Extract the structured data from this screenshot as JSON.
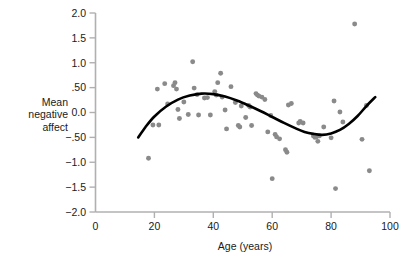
{
  "chart_data": {
    "type": "scatter",
    "title": "",
    "xlabel": "Age (years)",
    "ylabel": "Mean negative affect",
    "xlim": [
      0,
      100
    ],
    "ylim": [
      -2.0,
      2.0
    ],
    "grid": false,
    "legend": null,
    "xticks": [
      0,
      20,
      40,
      60,
      80,
      100
    ],
    "xticklabels": [
      "0",
      "20",
      "40",
      "60",
      "80",
      "100"
    ],
    "yticks": [
      2.0,
      1.5,
      1.0,
      0.5,
      0.0,
      -0.5,
      -1.0,
      -1.5,
      -2.0
    ],
    "yticklabels": [
      "2.0",
      "1.5",
      "1.0",
      ".50",
      "0.0",
      "−.50",
      "−1.0",
      "−1.5",
      "−2.0"
    ],
    "point_color": "#8a8a8a",
    "line_color": "#000000",
    "series": [
      {
        "name": "Mean negative affect by age",
        "marker": "circle",
        "points": [
          [
            18.0,
            -0.92
          ],
          [
            19.5,
            -0.25
          ],
          [
            21.0,
            0.47
          ],
          [
            21.5,
            -0.25
          ],
          [
            23.5,
            0.58
          ],
          [
            24.5,
            0.17
          ],
          [
            26.5,
            0.54
          ],
          [
            27.0,
            0.6
          ],
          [
            27.5,
            0.47
          ],
          [
            28.0,
            0.06
          ],
          [
            28.5,
            -0.12
          ],
          [
            30.0,
            0.21
          ],
          [
            31.5,
            -0.04
          ],
          [
            33.0,
            1.02
          ],
          [
            33.5,
            0.49
          ],
          [
            34.5,
            0.36
          ],
          [
            35.0,
            -0.05
          ],
          [
            37.0,
            0.29
          ],
          [
            38.0,
            0.3
          ],
          [
            39.0,
            -0.05
          ],
          [
            40.5,
            0.42
          ],
          [
            41.0,
            0.35
          ],
          [
            41.5,
            0.6
          ],
          [
            42.5,
            0.79
          ],
          [
            43.0,
            0.31
          ],
          [
            44.0,
            0.05
          ],
          [
            44.5,
            -0.33
          ],
          [
            46.0,
            0.52
          ],
          [
            47.5,
            0.2
          ],
          [
            48.5,
            -0.26
          ],
          [
            49.0,
            -0.29
          ],
          [
            49.5,
            0.13
          ],
          [
            51.0,
            -0.1
          ],
          [
            52.0,
            0.14
          ],
          [
            52.5,
            0.11
          ],
          [
            53.0,
            -0.26
          ],
          [
            54.5,
            0.38
          ],
          [
            55.0,
            0.35
          ],
          [
            55.5,
            0.33
          ],
          [
            56.5,
            0.31
          ],
          [
            57.5,
            0.26
          ],
          [
            58.5,
            -0.39
          ],
          [
            59.5,
            -0.06
          ],
          [
            60.0,
            -1.33
          ],
          [
            61.0,
            -0.44
          ],
          [
            61.5,
            -0.49
          ],
          [
            62.5,
            -0.53
          ],
          [
            64.5,
            -0.75
          ],
          [
            65.0,
            -0.8
          ],
          [
            65.5,
            0.15
          ],
          [
            66.5,
            0.18
          ],
          [
            69.0,
            -0.21
          ],
          [
            69.5,
            -0.18
          ],
          [
            70.5,
            -0.21
          ],
          [
            74.0,
            -0.47
          ],
          [
            74.5,
            -0.5
          ],
          [
            75.0,
            -0.49
          ],
          [
            75.5,
            -0.58
          ],
          [
            76.0,
            -0.47
          ],
          [
            77.5,
            -0.29
          ],
          [
            80.0,
            -0.51
          ],
          [
            81.0,
            0.23
          ],
          [
            81.5,
            -1.53
          ],
          [
            83.0,
            0.01
          ],
          [
            84.0,
            -0.19
          ],
          [
            88.0,
            1.78
          ],
          [
            90.5,
            -0.54
          ],
          [
            92.0,
            0.14
          ],
          [
            93.0,
            -1.17
          ]
        ]
      }
    ],
    "fit_curve": {
      "name": "cubic-trend",
      "x_range": [
        14.5,
        95.0
      ],
      "points": [
        [
          14.5,
          -0.5
        ],
        [
          17.0,
          -0.29
        ],
        [
          20.0,
          -0.08
        ],
        [
          24.0,
          0.12
        ],
        [
          28.0,
          0.26
        ],
        [
          32.0,
          0.34
        ],
        [
          36.0,
          0.38
        ],
        [
          40.0,
          0.37
        ],
        [
          44.0,
          0.32
        ],
        [
          48.0,
          0.24
        ],
        [
          52.0,
          0.14
        ],
        [
          56.0,
          0.03
        ],
        [
          60.0,
          -0.09
        ],
        [
          64.0,
          -0.21
        ],
        [
          68.0,
          -0.32
        ],
        [
          71.0,
          -0.39
        ],
        [
          74.0,
          -0.43
        ],
        [
          77.0,
          -0.45
        ],
        [
          80.0,
          -0.42
        ],
        [
          83.0,
          -0.35
        ],
        [
          86.0,
          -0.23
        ],
        [
          89.0,
          -0.07
        ],
        [
          92.0,
          0.13
        ],
        [
          95.0,
          0.31
        ]
      ]
    }
  },
  "axes": {
    "y_label_line1": "Mean",
    "y_label_line2": "negative",
    "y_label_line3": "affect",
    "x_label": "Age (years)"
  }
}
